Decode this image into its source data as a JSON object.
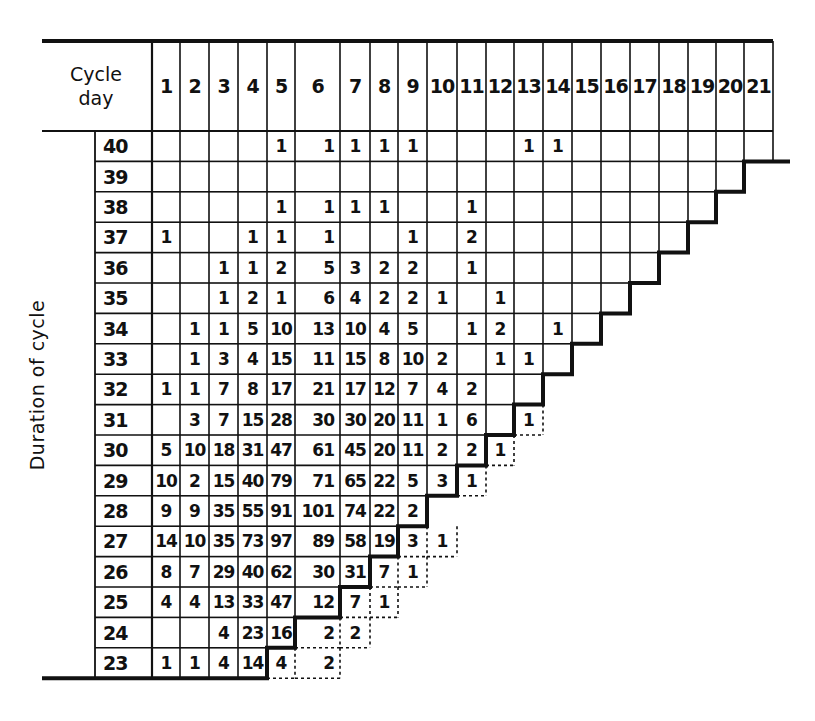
{
  "table": {
    "corner_label_line1": "Cycle",
    "corner_label_line2": "day",
    "row_axis_label": "Duration of cycle",
    "column_header_label": "Cycle day",
    "cycle_days": [
      1,
      2,
      3,
      4,
      5,
      6,
      7,
      8,
      9,
      10,
      11,
      12,
      13,
      14,
      15,
      16,
      17,
      18,
      19,
      20,
      21
    ],
    "rows": [
      {
        "duration": 40,
        "values": {
          "5": 1,
          "6": 1,
          "7": 1,
          "8": 1,
          "9": 1,
          "13": 1,
          "14": 1
        },
        "last_solid_day": 21,
        "dotted": {}
      },
      {
        "duration": 39,
        "values": {},
        "last_solid_day": 20,
        "dotted": {}
      },
      {
        "duration": 38,
        "values": {
          "5": 1,
          "6": 1,
          "7": 1,
          "8": 1,
          "11": 1
        },
        "last_solid_day": 19,
        "dotted": {}
      },
      {
        "duration": 37,
        "values": {
          "1": 1,
          "4": 1,
          "5": 1,
          "6": 1,
          "9": 1,
          "11": 2
        },
        "last_solid_day": 18,
        "dotted": {}
      },
      {
        "duration": 36,
        "values": {
          "3": 1,
          "4": 1,
          "5": 2,
          "6": 5,
          "7": 3,
          "8": 2,
          "9": 2,
          "11": 1
        },
        "last_solid_day": 17,
        "dotted": {}
      },
      {
        "duration": 35,
        "values": {
          "3": 1,
          "4": 2,
          "5": 1,
          "6": 6,
          "7": 4,
          "8": 2,
          "9": 2,
          "10": 1,
          "12": 1
        },
        "last_solid_day": 16,
        "dotted": {}
      },
      {
        "duration": 34,
        "values": {
          "2": 1,
          "3": 1,
          "4": 5,
          "5": 10,
          "6": 13,
          "7": 10,
          "8": 4,
          "9": 5,
          "11": 1,
          "12": 2,
          "14": 1
        },
        "last_solid_day": 15,
        "dotted": {}
      },
      {
        "duration": 33,
        "values": {
          "2": 1,
          "3": 3,
          "4": 4,
          "5": 15,
          "6": 11,
          "7": 15,
          "8": 8,
          "9": 10,
          "10": 2,
          "12": 1,
          "13": 1
        },
        "last_solid_day": 14,
        "dotted": {}
      },
      {
        "duration": 32,
        "values": {
          "1": 1,
          "2": 1,
          "3": 7,
          "4": 8,
          "5": 17,
          "6": 21,
          "7": 17,
          "8": 12,
          "9": 7,
          "10": 4,
          "11": 2
        },
        "last_solid_day": 13,
        "dotted": {}
      },
      {
        "duration": 31,
        "values": {
          "2": 3,
          "3": 7,
          "4": 15,
          "5": 28,
          "6": 30,
          "7": 30,
          "8": 20,
          "9": 11,
          "10": 1,
          "11": 6
        },
        "last_solid_day": 12,
        "dotted": {
          "13": 1
        }
      },
      {
        "duration": 30,
        "values": {
          "1": 5,
          "2": 10,
          "3": 18,
          "4": 31,
          "5": 47,
          "6": 61,
          "7": 45,
          "8": 20,
          "9": 11,
          "10": 2,
          "11": 2
        },
        "last_solid_day": 11,
        "dotted": {
          "12": 1
        }
      },
      {
        "duration": 29,
        "values": {
          "1": 10,
          "2": 2,
          "3": 15,
          "4": 40,
          "5": 79,
          "6": 71,
          "7": 65,
          "8": 22,
          "9": 5,
          "10": 3
        },
        "last_solid_day": 10,
        "dotted": {
          "11": 1
        }
      },
      {
        "duration": 28,
        "values": {
          "1": 9,
          "2": 9,
          "3": 35,
          "4": 55,
          "5": 91,
          "6": 101,
          "7": 74,
          "8": 22,
          "9": 2
        },
        "last_solid_day": 9,
        "dotted": {}
      },
      {
        "duration": 27,
        "values": {
          "1": 14,
          "2": 10,
          "3": 35,
          "4": 73,
          "5": 97,
          "6": 89,
          "7": 58,
          "8": 19
        },
        "last_solid_day": 8,
        "dotted": {
          "9": 3,
          "10": 1
        }
      },
      {
        "duration": 26,
        "values": {
          "1": 8,
          "2": 7,
          "3": 29,
          "4": 40,
          "5": 62,
          "6": 30,
          "7": 31
        },
        "last_solid_day": 7,
        "dotted": {
          "8": 7,
          "9": 1
        }
      },
      {
        "duration": 25,
        "values": {
          "1": 4,
          "2": 4,
          "3": 13,
          "4": 33,
          "5": 47,
          "6": 12
        },
        "last_solid_day": 6,
        "dotted": {
          "7": 7,
          "8": 1
        }
      },
      {
        "duration": 24,
        "values": {
          "3": 4,
          "4": 23,
          "5": 16
        },
        "last_solid_day": 5,
        "dotted": {
          "6": 2,
          "7": 2
        }
      },
      {
        "duration": 23,
        "values": {
          "1": 1,
          "2": 1,
          "3": 4,
          "4": 14
        },
        "last_solid_day": 4,
        "dotted": {
          "5": 4,
          "6": 2
        }
      }
    ]
  },
  "colors": {
    "ink": "#111111",
    "background": "#ffffff"
  }
}
